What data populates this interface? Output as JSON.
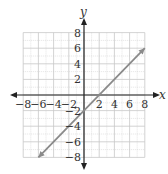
{
  "chart_data": {
    "type": "line",
    "title": "",
    "xlabel": "x",
    "ylabel": "y",
    "xlim": [
      -8,
      8
    ],
    "ylim": [
      -8,
      8
    ],
    "grid": true,
    "minor_grid": true,
    "x_ticks": [
      -8,
      -6,
      -4,
      -2,
      2,
      4,
      6,
      8
    ],
    "y_ticks": [
      8,
      6,
      4,
      2,
      -2,
      -4,
      -6,
      -8
    ],
    "x_tick_labels": [
      "−8",
      "−6",
      "−4",
      "−2",
      "2",
      "4",
      "6",
      "8"
    ],
    "y_tick_labels": [
      "8",
      "6",
      "4",
      "2",
      "−2",
      "−4",
      "−6",
      "−8"
    ],
    "series": [
      {
        "name": "y = x − 2",
        "equation": "y = x - 2",
        "x": [
          -6,
          8
        ],
        "y": [
          -8,
          6
        ],
        "arrows_both_ends": true,
        "color": "#8a8a8a"
      }
    ],
    "intercepts": {
      "x_intercept": 2,
      "y_intercept": -2
    },
    "legend": null
  },
  "colors": {
    "axis": "#222222",
    "grid": "#c8c8c8",
    "line": "#8a8a8a"
  }
}
